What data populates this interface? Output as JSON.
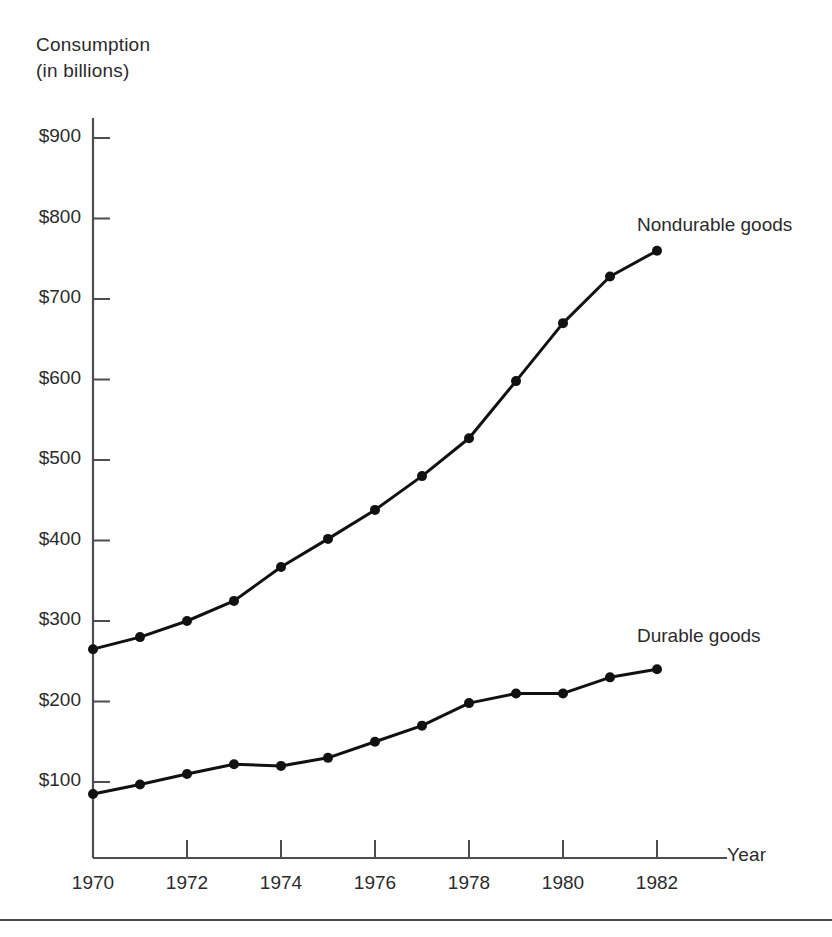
{
  "chart_data": {
    "type": "line",
    "ylabel": "Consumption (in billions)",
    "xlabel": "Year",
    "grid": false,
    "legend_position": "inline-right",
    "x": [
      1970,
      1971,
      1972,
      1973,
      1974,
      1975,
      1976,
      1977,
      1978,
      1979,
      1980,
      1981,
      1982
    ],
    "categories": [
      "1970",
      "1971",
      "1972",
      "1973",
      "1974",
      "1975",
      "1976",
      "1977",
      "1978",
      "1979",
      "1980",
      "1981",
      "1982"
    ],
    "xlim": [
      1970,
      1983
    ],
    "ylim": [
      0,
      900
    ],
    "xtick_labels": [
      "1970",
      "1972",
      "1974",
      "1976",
      "1978",
      "1980",
      "1982"
    ],
    "xtick_values": [
      1970,
      1972,
      1974,
      1976,
      1978,
      1980,
      1982
    ],
    "ytick_labels": [
      "$900",
      "$800",
      "$700",
      "$600",
      "$500",
      "$400",
      "$300",
      "$200",
      "$100"
    ],
    "ytick_values": [
      900,
      800,
      700,
      600,
      500,
      400,
      300,
      200,
      100
    ],
    "series": [
      {
        "name": "Nondurable goods",
        "values": [
          265,
          280,
          300,
          325,
          367,
          402,
          438,
          480,
          527,
          598,
          670,
          728,
          760
        ]
      },
      {
        "name": "Durable goods",
        "values": [
          85,
          97,
          110,
          122,
          120,
          130,
          150,
          170,
          198,
          210,
          210,
          230,
          240
        ]
      }
    ],
    "marker": "filled-circle",
    "line_color": "#111111",
    "text_color": "#2b2b2b"
  },
  "axis": {
    "y_title_line1": "Consumption",
    "y_title_line2": "(in billions)",
    "x_title": "Year"
  },
  "labels": {
    "nondurable": "Nondurable goods",
    "durable": "Durable goods"
  }
}
